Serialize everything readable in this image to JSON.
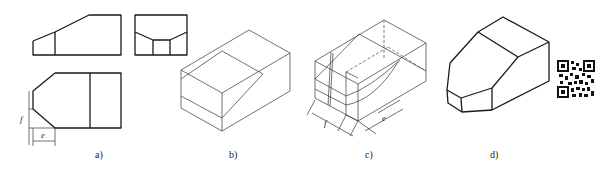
{
  "figure": {
    "panels": [
      {
        "id": "a",
        "caption": "a)",
        "description": "Three orthographic views (front, side, top) of a block with chamfered corner"
      },
      {
        "id": "b",
        "caption": "b)",
        "description": "Isometric bounding box with construction lines"
      },
      {
        "id": "c",
        "caption": "c)",
        "description": "Isometric construction with dimensions f and e"
      },
      {
        "id": "d",
        "caption": "d)",
        "description": "Finished isometric drawing of the part"
      }
    ],
    "dimensions": {
      "f_label": "f",
      "e_label": "e",
      "c_f_label": "f",
      "c_e_label": "e"
    },
    "qr_code": {
      "present": true
    }
  }
}
